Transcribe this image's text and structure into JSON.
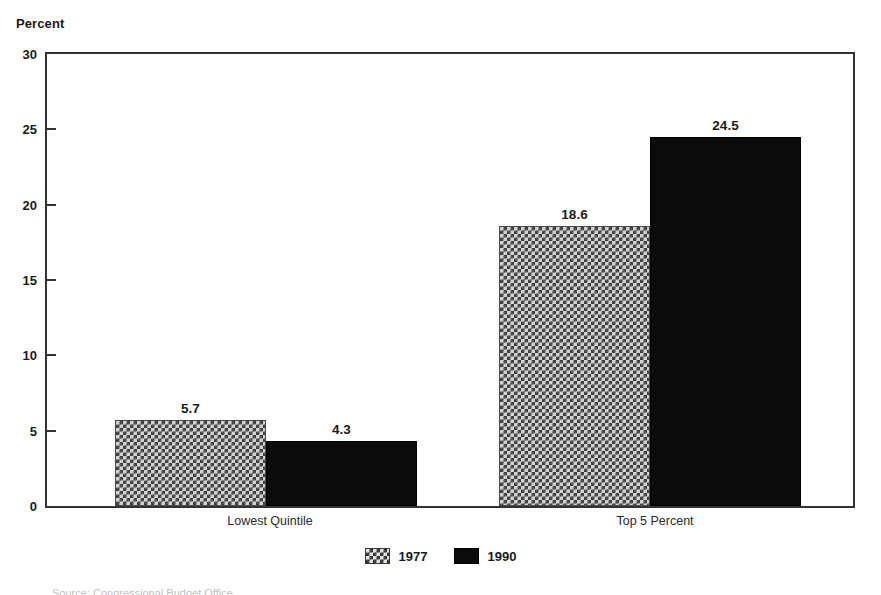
{
  "chart_data": {
    "type": "bar",
    "title": "",
    "xlabel": "",
    "ylabel": "Percent",
    "ylim": [
      0,
      30
    ],
    "ytick_labels": [
      "0",
      "5",
      "10",
      "15",
      "20",
      "25",
      "30"
    ],
    "ytick_values": [
      0,
      5,
      10,
      15,
      20,
      25,
      30
    ],
    "grid": false,
    "legend_position": "bottom-center",
    "categories": [
      "Lowest Quintile",
      "Top 5 Percent"
    ],
    "series": [
      {
        "name": "1977",
        "pattern": "hatch",
        "color": "#d2d2d2",
        "values": [
          5.7,
          18.6
        ],
        "labels": [
          "5.7",
          "18.6"
        ]
      },
      {
        "name": "1990",
        "pattern": "solid",
        "color": "#0b0b0b",
        "values": [
          4.3,
          24.5
        ],
        "labels": [
          "4.3",
          "24.5"
        ]
      }
    ]
  },
  "axis": {
    "y_title": "Percent"
  },
  "legend": {
    "items": [
      {
        "label": "1977",
        "pattern": "hatch"
      },
      {
        "label": "1990",
        "pattern": "solid"
      }
    ]
  },
  "footer": {
    "source_note": "Source: Congressional Budget Office"
  }
}
